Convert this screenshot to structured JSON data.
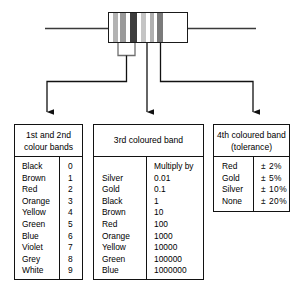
{
  "diagram": {
    "resistor": {
      "name": "resistor",
      "body_fill": "#ffffff",
      "outline_color": "#1a1a1a",
      "lead_color": "#3a3a3a",
      "bands": [
        {
          "index": 1,
          "label": "band-1",
          "color": "#b3b3b3",
          "left": 4,
          "width": 5
        },
        {
          "index": 2,
          "label": "band-2",
          "color": "#9a9a9a",
          "left": 11,
          "width": 6
        },
        {
          "index": 3,
          "label": "band-3",
          "color": "#3d3d3d",
          "left": 21,
          "width": 7
        },
        {
          "index": 4,
          "label": "band-4",
          "color": "#c4c4c4",
          "left": 32,
          "width": 5
        },
        {
          "index": 5,
          "label": "band-5",
          "color": "#b0b0b0",
          "left": 41,
          "width": 4
        },
        {
          "index": 6,
          "label": "band-6",
          "color": "#7a7a7a",
          "left": 48,
          "width": 6
        }
      ]
    },
    "connectors": [
      {
        "name": "connector-first-second-bands",
        "target": "table-colours"
      },
      {
        "name": "connector-third-band",
        "target": "table-multiplier"
      },
      {
        "name": "connector-fourth-band",
        "target": "table-tolerance"
      }
    ]
  },
  "tables": {
    "colours": {
      "name": "1st-and-2nd-colour-bands",
      "title_line1": "1st and 2nd",
      "title_line2": "colour bands",
      "value_header": "",
      "rows": [
        {
          "colour": "Black",
          "value": "0"
        },
        {
          "colour": "Brown",
          "value": "1"
        },
        {
          "colour": "Red",
          "value": "2"
        },
        {
          "colour": "Orange",
          "value": "3"
        },
        {
          "colour": "Yellow",
          "value": "4"
        },
        {
          "colour": "Green",
          "value": "5"
        },
        {
          "colour": "Blue",
          "value": "6"
        },
        {
          "colour": "Violet",
          "value": "7"
        },
        {
          "colour": "Grey",
          "value": "8"
        },
        {
          "colour": "White",
          "value": "9"
        }
      ]
    },
    "multiplier": {
      "name": "3rd-coloured-band",
      "title_line1": "3rd coloured band",
      "title_line2": "",
      "value_header": "Multiply by",
      "rows": [
        {
          "colour": "Silver",
          "value": "0.01"
        },
        {
          "colour": "Gold",
          "value": "0.1"
        },
        {
          "colour": "Black",
          "value": "1"
        },
        {
          "colour": "Brown",
          "value": "10"
        },
        {
          "colour": "Red",
          "value": "100"
        },
        {
          "colour": "Orange",
          "value": "1000"
        },
        {
          "colour": "Yellow",
          "value": "10000"
        },
        {
          "colour": "Green",
          "value": "100000"
        },
        {
          "colour": "Blue",
          "value": "1000000"
        }
      ]
    },
    "tolerance": {
      "name": "4th-coloured-band-tolerance",
      "title_line1": "4th coloured band",
      "title_line2": "(tolerance)",
      "value_header": "",
      "rows": [
        {
          "colour": "Red",
          "value": "± 2%"
        },
        {
          "colour": "Gold",
          "value": "± 5%"
        },
        {
          "colour": "Silver",
          "value": "± 10%"
        },
        {
          "colour": "None",
          "value": "± 20%"
        }
      ]
    }
  }
}
